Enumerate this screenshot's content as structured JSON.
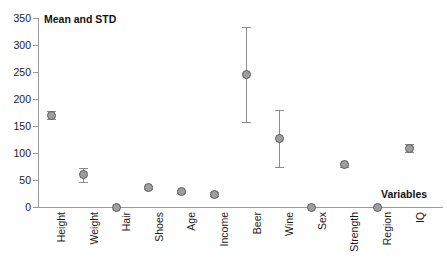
{
  "chart_data": {
    "type": "scatter",
    "title": "",
    "ylabel": "Mean and STD",
    "xlabel": "Variables",
    "ylim": [
      0,
      350
    ],
    "yticks": [
      0,
      50,
      100,
      150,
      200,
      250,
      300,
      350
    ],
    "grid": false,
    "legend": null,
    "error_bars": "std",
    "categories": [
      "Height",
      "Weight",
      "Hair",
      "Shoes",
      "Age",
      "Income",
      "Beer",
      "Wine",
      "Sex",
      "Strength",
      "Region",
      "IQ"
    ],
    "values": [
      170,
      60,
      0,
      36,
      29,
      24,
      245,
      127,
      0,
      78,
      0,
      109
    ],
    "errors": [
      7,
      13,
      0,
      3,
      3,
      4,
      88,
      53,
      0,
      3,
      0,
      7
    ],
    "marker": {
      "shape": "circle",
      "fill": "#9e9e9e",
      "edge": "#5e5e5e"
    },
    "axis_color": "#9a9a9a"
  },
  "axes": {
    "y_caption": "Mean and STD",
    "x_caption": "Variables",
    "y_tick_labels": [
      "350",
      "300",
      "250",
      "200",
      "150",
      "100",
      "50",
      "0"
    ]
  }
}
